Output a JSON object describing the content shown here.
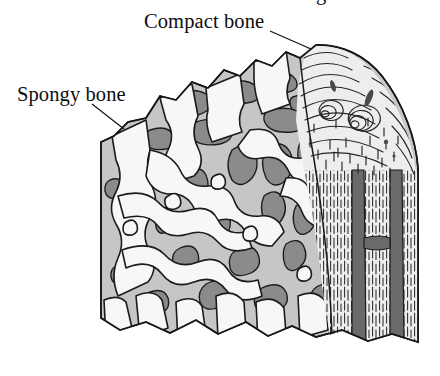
{
  "figure": {
    "subject": "bone",
    "view": "cut-away sectional view of spongy and compact bone",
    "background_color": "#ffffff",
    "width": 440,
    "height": 376
  },
  "labels": [
    {
      "id": "compact-bone",
      "text": "Compact bone",
      "x": 144,
      "y": 11,
      "leader": {
        "from_x": 270,
        "from_y": 31,
        "to_x": 311,
        "to_y": 49
      }
    },
    {
      "id": "spongy-bone",
      "text": "Spongy bone",
      "x": 17,
      "y": 84,
      "leader": {
        "from_x": 92,
        "from_y": 104,
        "to_x": 124,
        "to_y": 129
      }
    }
  ],
  "clipped_text_top": {
    "text": "g",
    "note": "fragment of text line cropped at top edge of image"
  },
  "colors": {
    "background": "#ffffff",
    "ink": "#111111",
    "outline": "#1a1a1a",
    "trabecula_face": "#ffffff",
    "trabecula_light": "#eaeaea",
    "matrix_light_gray": "#c9c9c9",
    "cavity_mid_gray": "#a8a8a8",
    "cavity_dark_gray": "#8a8a8a",
    "canal_dark": "#6e6e6e",
    "compact_fill": "#f0f0f0",
    "lamella_line": "#2a2a2a"
  },
  "regions": [
    {
      "id": "spongy-bone-region",
      "name": "Spongy bone",
      "description": "porous trabecular lattice of interconnecting bony struts with marrow cavities",
      "location": "left and center of the specimen"
    },
    {
      "id": "compact-bone-region",
      "name": "Compact bone",
      "description": "dense outer cortical shell drawn with concentric osteon lamellae and longitudinal striations",
      "location": "right edge of the specimen"
    },
    {
      "id": "haversian-canals",
      "name": "Haversian canals",
      "description": "dark vertical channels running through the compact bone",
      "location": "lower right of the specimen"
    }
  ]
}
